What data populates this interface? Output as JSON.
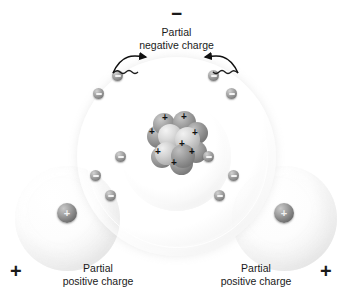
{
  "diagram": {
    "type": "molecular-polarity",
    "background_color": "#ffffff",
    "labels": {
      "negative_sign": "−",
      "negative_caption": "Partial\nnegative charge",
      "positive_sign_left": "+",
      "positive_sign_right": "+",
      "positive_caption_left": "Partial\npositive charge",
      "positive_caption_right": "Partial\npositive charge"
    },
    "atoms": [
      {
        "id": "oxygen",
        "element": "O",
        "role": "central-atom",
        "nucleus_charge_symbol": "+",
        "nucleus_proton_count": 8,
        "shells": [
          {
            "name": "inner-shell",
            "electron_count": 2
          },
          {
            "name": "outer-shell",
            "electron_count": 8
          }
        ]
      },
      {
        "id": "hydrogen-left",
        "element": "H",
        "role": "bonded-atom",
        "nucleus_charge_symbol": "+",
        "shells": [
          {
            "name": "shell",
            "electron_count": 1
          }
        ]
      },
      {
        "id": "hydrogen-right",
        "element": "H",
        "role": "bonded-atom",
        "nucleus_charge_symbol": "+",
        "shells": [
          {
            "name": "shell",
            "electron_count": 1
          }
        ]
      }
    ],
    "electron_symbol": "−",
    "arrows": {
      "count": 2,
      "style": "wavy",
      "direction": "inward-to-top-center",
      "meaning": "electron density shifted toward oxygen"
    },
    "colors": {
      "text": "#1a1a1a",
      "electron": "#8a8a8a",
      "nucleus": "#8f8f8f",
      "shell": "#e4e4e4"
    }
  }
}
